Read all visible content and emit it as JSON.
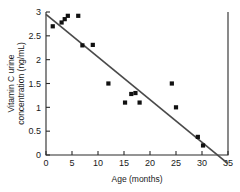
{
  "chart_data": {
    "type": "scatter",
    "title": "",
    "xlabel": "Age (months)",
    "ylabel": "Vitamin C urine concentration (ng/mL)",
    "ylabel_line1": "Vitamin C urine",
    "ylabel_line2": "concentration (ng/mL)",
    "xlim": [
      0,
      35
    ],
    "ylim": [
      0,
      3
    ],
    "xticks": [
      0,
      5,
      10,
      15,
      20,
      25,
      30,
      35
    ],
    "yticks": [
      0,
      0.5,
      1,
      1.5,
      2,
      2.5,
      3
    ],
    "xtick_labels": [
      "0",
      "5",
      "10",
      "15",
      "20",
      "25",
      "30",
      "35"
    ],
    "ytick_labels": [
      "0",
      "0.5",
      "1",
      "1.5",
      "2",
      "2.5",
      "3"
    ],
    "grid": false,
    "legend": false,
    "marker": "square",
    "marker_color": "#111111",
    "points": [
      {
        "x": 1.3,
        "y": 2.7
      },
      {
        "x": 3.0,
        "y": 2.78
      },
      {
        "x": 3.6,
        "y": 2.85
      },
      {
        "x": 4.2,
        "y": 2.92
      },
      {
        "x": 6.2,
        "y": 2.92
      },
      {
        "x": 7.0,
        "y": 2.3
      },
      {
        "x": 9.0,
        "y": 2.31
      },
      {
        "x": 12.0,
        "y": 1.5
      },
      {
        "x": 15.2,
        "y": 1.1
      },
      {
        "x": 16.4,
        "y": 1.28
      },
      {
        "x": 17.2,
        "y": 1.3
      },
      {
        "x": 18.0,
        "y": 1.1
      },
      {
        "x": 24.2,
        "y": 1.5
      },
      {
        "x": 25.0,
        "y": 1.0
      },
      {
        "x": 29.2,
        "y": 0.38
      },
      {
        "x": 30.2,
        "y": 0.2
      }
    ],
    "fit_line": {
      "x_start": 0,
      "y_start": 2.95,
      "x_end": 35,
      "y_end": -0.18,
      "x_intercept": 33,
      "color": "#4a4a4a"
    }
  }
}
